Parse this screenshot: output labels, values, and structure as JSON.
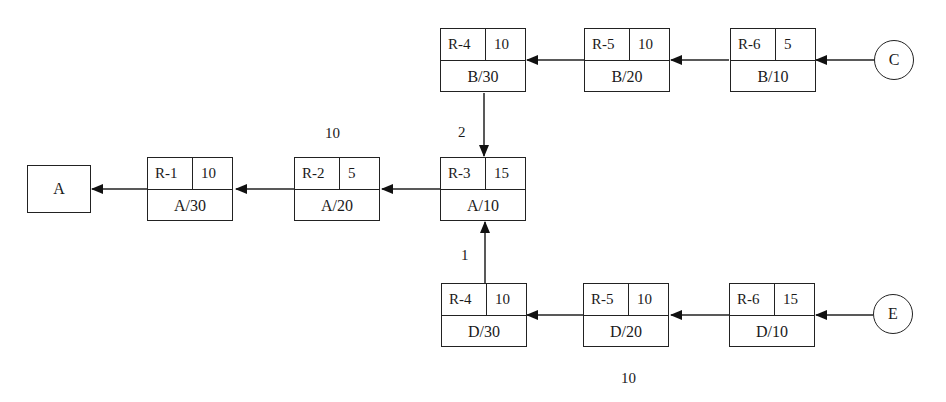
{
  "sink": {
    "label": "A"
  },
  "sources": [
    {
      "label": "C"
    },
    {
      "label": "E"
    }
  ],
  "nodes": [
    {
      "id": "R-1",
      "qty": "10",
      "lot": "A/30"
    },
    {
      "id": "R-2",
      "qty": "5",
      "lot": "A/20"
    },
    {
      "id": "R-3",
      "qty": "15",
      "lot": "A/10"
    },
    {
      "id": "R-4",
      "qty": "10",
      "lot": "B/30"
    },
    {
      "id": "R-5",
      "qty": "10",
      "lot": "B/20"
    },
    {
      "id": "R-6",
      "qty": "5",
      "lot": "B/10"
    },
    {
      "id": "R-4",
      "qty": "10",
      "lot": "D/30"
    },
    {
      "id": "R-5",
      "qty": "10",
      "lot": "D/20"
    },
    {
      "id": "R-6",
      "qty": "15",
      "lot": "D/10"
    }
  ],
  "labels": {
    "top_middle": "10",
    "branch_top": "2",
    "branch_bottom": "1",
    "bottom_middle": "10"
  }
}
